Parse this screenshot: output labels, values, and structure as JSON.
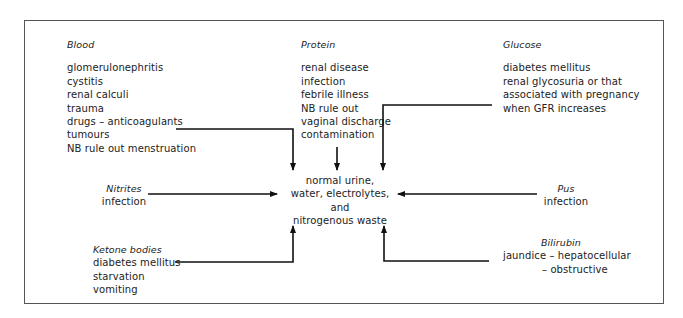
{
  "diagram": {
    "center": {
      "lines": [
        "normal urine,",
        "water, electrolytes, and",
        "nitrogenous waste"
      ]
    },
    "blood": {
      "heading": "Blood",
      "items": [
        "glomerulonephritis",
        "cystitis",
        "renal calculi",
        "trauma",
        "drugs – anticoagulants",
        "tumours",
        "NB rule out menstruation"
      ]
    },
    "protein": {
      "heading": "Protein",
      "items": [
        "renal disease",
        "infection",
        "febrile illness",
        "NB rule out",
        "vaginal discharge",
        "contamination"
      ]
    },
    "glucose": {
      "heading": "Glucose",
      "items": [
        "diabetes mellitus",
        "renal glycosuria or that",
        "associated with pregnancy",
        "when GFR increases"
      ]
    },
    "nitrites": {
      "heading": "Nitrites",
      "items": [
        "infection"
      ]
    },
    "pus": {
      "heading": "Pus",
      "items": [
        "infection"
      ]
    },
    "ketone": {
      "heading": "Ketone bodies",
      "items": [
        "diabetes mellitus",
        "starvation",
        "vomiting"
      ]
    },
    "bilirubin": {
      "heading": "Bilirubin",
      "items": [
        "jaundice – hepatocellular",
        "– obstructive"
      ]
    },
    "colors": {
      "line": "#111111",
      "frame": "#555555",
      "text": "#222222"
    }
  }
}
